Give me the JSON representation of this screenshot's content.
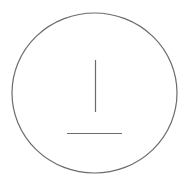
{
  "diagram": {
    "shape": "circle-with-symbol",
    "symbol": "perpendicular-sign",
    "stroke_color": "#6b6b6b",
    "background": "#ffffff",
    "circle": {
      "cx": 94.5,
      "cy": 93,
      "rx": 82.5,
      "ry": 80
    },
    "vertical_line": {
      "x1": 95.5,
      "y1": 60,
      "x2": 95.5,
      "y2": 112
    },
    "horizontal_line": {
      "x1": 67,
      "y1": 133.5,
      "x2": 122,
      "y2": 133.5
    }
  }
}
